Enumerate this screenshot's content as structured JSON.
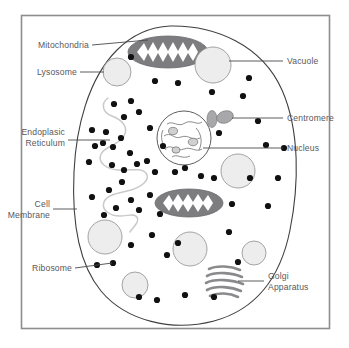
{
  "figure": {
    "background_color": "#ffffff",
    "frame_color": "#8d8d90"
  },
  "labels": {
    "mitochondria": "Mitochondria",
    "lysosome": "Lysosome",
    "endoplasmic_reticulum_line1": "Endoplasic",
    "endoplasmic_reticulum_line2": "Reticulum",
    "cell_membrane_line1": "Cell",
    "cell_membrane_line2": "Membrane",
    "ribosome": "Ribosome",
    "vacuole": "Vacuole",
    "centromere": "Centromere",
    "nucleus": "Nucleus",
    "golgi_line1": "Golgi",
    "golgi_line2": "Apparatus"
  },
  "colors": {
    "label_text": "#58585a",
    "leader_line": "#4a4a4c",
    "membrane_outline": "#3f3f41",
    "vesicle_fill": "#ededed",
    "vesicle_stroke": "#9a9a9c",
    "mitochondria_fill": "#7d7d7f",
    "golgi_stroke": "#8a8a8c",
    "centromere_fill": "#a8a8aa",
    "ribosome_fill": "#111111",
    "er_stroke": "#c9c9c9"
  },
  "structures": {
    "vesicles": [
      {
        "name": "lysosome",
        "cx": 117,
        "cy": 72,
        "r": 14
      },
      {
        "name": "vacuole",
        "cx": 213,
        "cy": 65,
        "r": 18
      },
      {
        "name": "vesicle-right-mid",
        "cx": 238,
        "cy": 171,
        "r": 17
      },
      {
        "name": "vesicle-left-low",
        "cx": 105,
        "cy": 237,
        "r": 17
      },
      {
        "name": "vesicle-center-low",
        "cx": 190,
        "cy": 249,
        "r": 17
      },
      {
        "name": "vesicle-right-low",
        "cx": 254,
        "cy": 253,
        "r": 12
      },
      {
        "name": "vesicle-bottom-left",
        "cx": 135,
        "cy": 285,
        "r": 13
      }
    ],
    "mitochondria": [
      {
        "name": "mitochondrion-top",
        "cx": 168,
        "cy": 52,
        "rx": 40,
        "ry": 16
      },
      {
        "name": "mitochondrion-center",
        "cx": 189,
        "cy": 203,
        "rx": 34,
        "ry": 14
      }
    ],
    "nucleus": {
      "cx": 184,
      "cy": 138,
      "r": 27
    },
    "centromeres": [
      {
        "cx": 212,
        "cy": 119,
        "rx": 5,
        "ry": 8,
        "rotate": 0
      },
      {
        "cx": 225,
        "cy": 117,
        "rx": 8,
        "ry": 6,
        "rotate": -18
      }
    ],
    "golgi": {
      "cx": 224,
      "cy": 281,
      "disc_count": 5
    },
    "ribosome_count": 58
  },
  "ribosome_positions": [
    [
      131,
      57
    ],
    [
      155,
      81
    ],
    [
      178,
      83
    ],
    [
      212,
      92
    ],
    [
      243,
      96
    ],
    [
      249,
      78
    ],
    [
      219,
      133
    ],
    [
      258,
      121
    ],
    [
      266,
      145
    ],
    [
      114,
      104
    ],
    [
      124,
      117
    ],
    [
      131,
      101
    ],
    [
      139,
      112
    ],
    [
      150,
      128
    ],
    [
      106,
      132
    ],
    [
      92,
      130
    ],
    [
      103,
      143
    ],
    [
      113,
      147
    ],
    [
      121,
      138
    ],
    [
      130,
      153
    ],
    [
      112,
      165
    ],
    [
      124,
      170
    ],
    [
      137,
      164
    ],
    [
      147,
      161
    ],
    [
      155,
      172
    ],
    [
      95,
      146
    ],
    [
      89,
      162
    ],
    [
      163,
      146
    ],
    [
      175,
      172
    ],
    [
      185,
      168
    ],
    [
      201,
      176
    ],
    [
      214,
      178
    ],
    [
      92,
      197
    ],
    [
      109,
      190
    ],
    [
      122,
      182
    ],
    [
      131,
      200
    ],
    [
      139,
      210
    ],
    [
      150,
      195
    ],
    [
      116,
      208
    ],
    [
      104,
      215
    ],
    [
      160,
      214
    ],
    [
      232,
      204
    ],
    [
      268,
      206
    ],
    [
      278,
      178
    ],
    [
      284,
      148
    ],
    [
      229,
      232
    ],
    [
      152,
      235
    ],
    [
      131,
      245
    ],
    [
      113,
      263
    ],
    [
      167,
      255
    ],
    [
      97,
      265
    ],
    [
      139,
      297
    ],
    [
      157,
      300
    ],
    [
      185,
      295
    ],
    [
      214,
      297
    ],
    [
      178,
      243
    ],
    [
      238,
      262
    ],
    [
      250,
      178
    ]
  ]
}
